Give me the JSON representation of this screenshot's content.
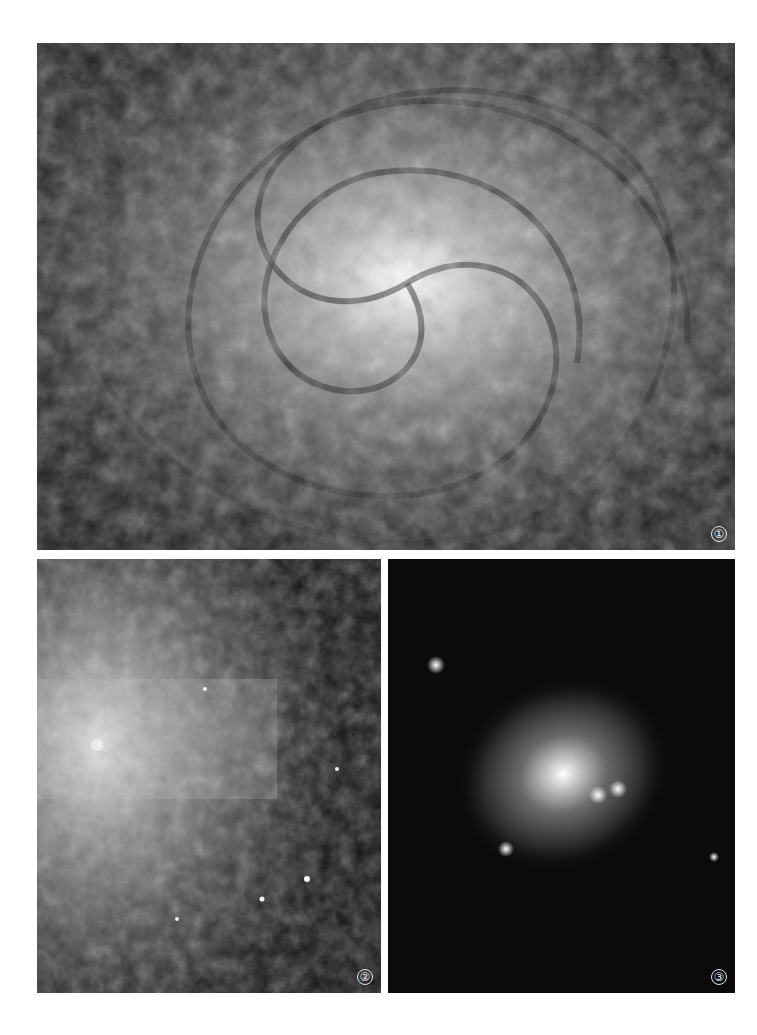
{
  "figure": {
    "panels": [
      {
        "id": "1",
        "label": "①",
        "subject": "face-on spiral galaxy with tightly wound dusty arms and bright core"
      },
      {
        "id": "2",
        "label": "②",
        "subject": "irregular galaxy with bright star-forming knots and bar"
      },
      {
        "id": "3",
        "label": "③",
        "subject": "elliptical galaxy amid dense starfield"
      }
    ],
    "colors": {
      "background": "#ffffff",
      "panel_dark": "#0d0d0d",
      "label": "#e8e8e8"
    }
  }
}
